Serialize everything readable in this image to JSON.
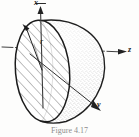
{
  "figure": {
    "caption": "Figure 4.17",
    "background_color": "#fdfdfc",
    "ink_color": "#1b1b1b",
    "stipple_color": "#6f6f6f",
    "hatch_color": "#4a4a4a"
  },
  "axes": [
    {
      "name": "x",
      "label": "x",
      "orientation": "vertical-up",
      "style": "solid-with-arrowhead"
    },
    {
      "name": "z",
      "label": "z",
      "orientation": "right-horizontal",
      "style": "dash-dot-with-arrowhead"
    },
    {
      "name": "y",
      "label": "y",
      "orientation": "lower-right-oblique",
      "style": "solid-with-arrowhead"
    }
  ],
  "annotations": [
    {
      "name": "radius",
      "label": "r",
      "kind": "arrow-from-center-to-rim"
    }
  ],
  "solid": {
    "kind": "hemisphere",
    "flat_face": "hatched-ellipse",
    "curved_surface": "stippled-dome"
  }
}
